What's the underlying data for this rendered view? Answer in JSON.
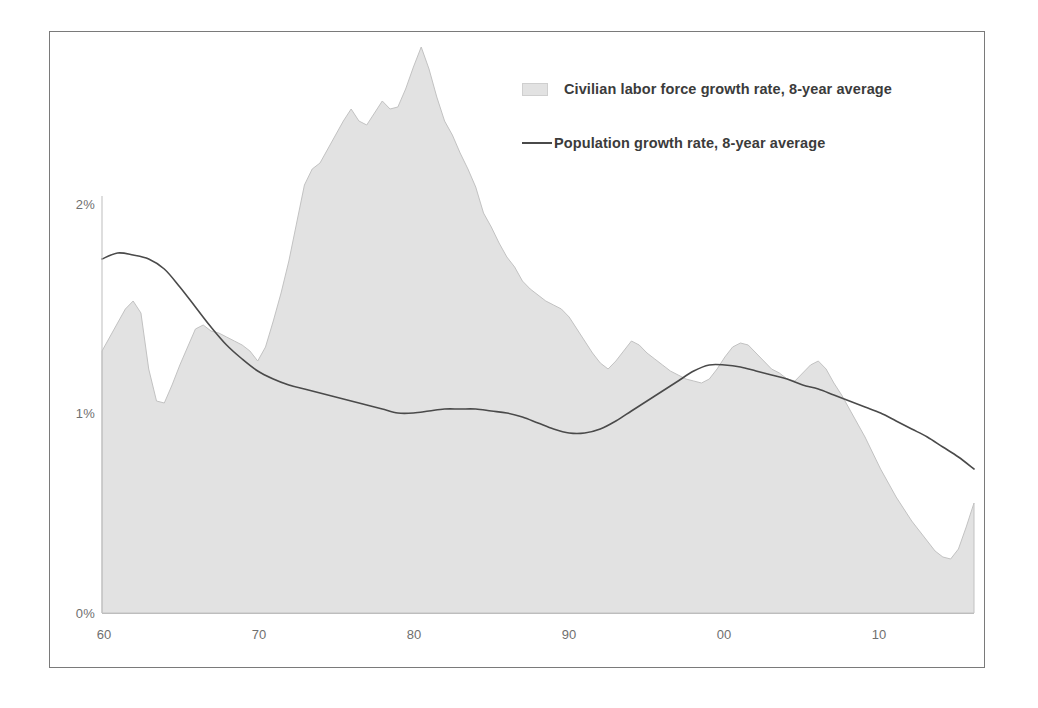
{
  "chart_data": {
    "type": "area",
    "title": "",
    "subtitle": "",
    "xlabel": "",
    "ylabel": "",
    "xlim": [
      1960,
      2016
    ],
    "ylim": [
      0,
      3.0
    ],
    "grid": false,
    "legend_position": "top-right",
    "y_ticks": [
      "0%",
      "1%",
      "2%"
    ],
    "y_tick_values": [
      0,
      1,
      2
    ],
    "x_ticks": [
      "60",
      "70",
      "80",
      "90",
      "00",
      "10"
    ],
    "x_tick_values": [
      1960,
      1970,
      1980,
      1990,
      2000,
      2010
    ],
    "series": [
      {
        "name": "Civilian labor force growth rate, 8-year average",
        "render": "area",
        "fill_color": "#e2e2e2",
        "line_color": "#c2c2c2",
        "x": [
          1960,
          1961,
          1961.5,
          1962,
          1962.5,
          1963,
          1963.5,
          1964,
          1964.5,
          1965,
          1965.5,
          1966,
          1966.5,
          1967,
          1967.5,
          1968,
          1968.5,
          1969,
          1969.5,
          1970,
          1970.5,
          1971,
          1971.5,
          1972,
          1972.5,
          1973,
          1973.5,
          1974,
          1974.5,
          1975,
          1975.5,
          1976,
          1976.5,
          1977,
          1977.5,
          1978,
          1978.5,
          1979,
          1979.5,
          1980,
          1980.5,
          1981,
          1981.5,
          1982,
          1982.5,
          1983,
          1983.5,
          1984,
          1984.5,
          1985,
          1985.5,
          1986,
          1986.5,
          1987,
          1987.5,
          1988,
          1988.5,
          1989,
          1989.5,
          1990,
          1990.5,
          1991,
          1991.5,
          1992,
          1992.5,
          1993,
          1993.5,
          1994,
          1994.5,
          1995,
          1995.5,
          1996,
          1996.5,
          1997,
          1997.5,
          1998,
          1998.5,
          1999,
          1999.5,
          2000,
          2000.5,
          2001,
          2001.5,
          2002,
          2002.5,
          2003,
          2003.5,
          2004,
          2004.5,
          2005,
          2005.5,
          2006,
          2006.5,
          2007,
          2007.5,
          2008,
          2008.5,
          2009,
          2009.5,
          2010,
          2010.5,
          2011,
          2011.5,
          2012,
          2012.5,
          2013,
          2013.5,
          2014,
          2014.5,
          2015,
          2015.5,
          2016
        ],
        "y": [
          1.31,
          1.45,
          1.52,
          1.56,
          1.5,
          1.22,
          1.06,
          1.05,
          1.14,
          1.24,
          1.33,
          1.42,
          1.44,
          1.41,
          1.4,
          1.38,
          1.36,
          1.34,
          1.31,
          1.26,
          1.33,
          1.46,
          1.6,
          1.76,
          1.95,
          2.14,
          2.22,
          2.25,
          2.32,
          2.39,
          2.46,
          2.52,
          2.46,
          2.44,
          2.5,
          2.56,
          2.52,
          2.53,
          2.62,
          2.73,
          2.83,
          2.72,
          2.58,
          2.46,
          2.39,
          2.3,
          2.22,
          2.13,
          2.0,
          1.93,
          1.85,
          1.78,
          1.73,
          1.66,
          1.62,
          1.59,
          1.56,
          1.54,
          1.52,
          1.48,
          1.42,
          1.36,
          1.3,
          1.25,
          1.22,
          1.26,
          1.31,
          1.36,
          1.34,
          1.3,
          1.27,
          1.24,
          1.21,
          1.19,
          1.17,
          1.16,
          1.15,
          1.17,
          1.22,
          1.28,
          1.33,
          1.35,
          1.34,
          1.3,
          1.26,
          1.22,
          1.2,
          1.17,
          1.16,
          1.2,
          1.24,
          1.26,
          1.22,
          1.15,
          1.09,
          1.02,
          0.95,
          0.88,
          0.8,
          0.72,
          0.65,
          0.58,
          0.52,
          0.46,
          0.41,
          0.36,
          0.31,
          0.28,
          0.27,
          0.32,
          0.43,
          0.55
        ]
      },
      {
        "name": "Population growth rate, 8-year average",
        "render": "line",
        "line_color": "#4a4a4a",
        "x": [
          1960,
          1961,
          1962,
          1963,
          1964,
          1965,
          1966,
          1967,
          1968,
          1969,
          1970,
          1971,
          1972,
          1973,
          1974,
          1975,
          1976,
          1977,
          1978,
          1979,
          1980,
          1981,
          1982,
          1983,
          1984,
          1985,
          1986,
          1987,
          1988,
          1989,
          1990,
          1991,
          1992,
          1993,
          1994,
          1995,
          1996,
          1997,
          1998,
          1999,
          2000,
          2001,
          2002,
          2003,
          2004,
          2005,
          2006,
          2007,
          2008,
          2009,
          2010,
          2011,
          2012,
          2013,
          2014,
          2015,
          2016
        ],
        "y": [
          1.77,
          1.8,
          1.79,
          1.77,
          1.72,
          1.63,
          1.53,
          1.43,
          1.34,
          1.27,
          1.21,
          1.17,
          1.14,
          1.12,
          1.1,
          1.08,
          1.06,
          1.04,
          1.02,
          1.0,
          1.0,
          1.01,
          1.02,
          1.02,
          1.02,
          1.01,
          1.0,
          0.98,
          0.95,
          0.92,
          0.9,
          0.9,
          0.92,
          0.96,
          1.01,
          1.06,
          1.11,
          1.16,
          1.21,
          1.24,
          1.24,
          1.23,
          1.21,
          1.19,
          1.17,
          1.14,
          1.12,
          1.09,
          1.06,
          1.03,
          1.0,
          0.96,
          0.92,
          0.88,
          0.83,
          0.78,
          0.72
        ]
      }
    ]
  },
  "legend": {
    "items": [
      {
        "label": "Civilian labor force growth rate, 8-year average",
        "marker": "area-swatch"
      },
      {
        "label": "Population growth rate, 8-year average",
        "marker": "line-swatch"
      }
    ]
  },
  "axes": {
    "y_labels": [
      "2%",
      "1%",
      "0%"
    ],
    "x_labels": [
      "60",
      "70",
      "80",
      "90",
      "00",
      "10"
    ]
  },
  "colors": {
    "area_fill": "#e2e2e2",
    "area_stroke": "#c2c2c2",
    "line": "#4a4a4a",
    "axis_text": "#6f6f6f",
    "frame": "#7a7a7a",
    "legend_text": "#3b3b3b"
  }
}
